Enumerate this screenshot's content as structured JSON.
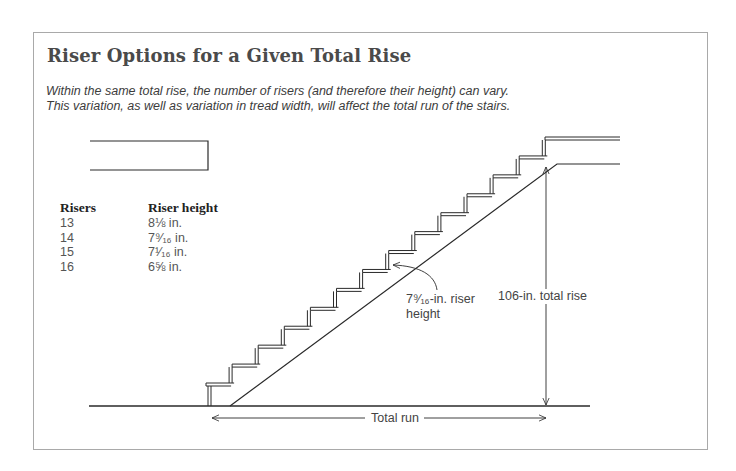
{
  "title": "Riser Options for a Given Total Rise",
  "caption": {
    "line1": "Within the same total rise, the number of risers (and therefore their height) can vary.",
    "line2": "This variation, as well as variation in tread width, will affect the total run of the stairs."
  },
  "table": {
    "headers": {
      "risers": "Risers",
      "height": "Riser height"
    },
    "rows": [
      {
        "risers": "13",
        "height": "8⅛ in."
      },
      {
        "risers": "14",
        "height": "7⁹⁄₁₆ in."
      },
      {
        "risers": "15",
        "height": "7¹⁄₁₆ in."
      },
      {
        "risers": "16",
        "height": "6⅝ in."
      }
    ]
  },
  "labels": {
    "riser_height_line1": "7⁹⁄₁₆-in. riser",
    "riser_height_line2": "height",
    "total_rise": "106-in. total rise",
    "total_run": "Total run"
  },
  "diagram": {
    "step_count": 14,
    "total_rise_in": 106,
    "riser_height_in": "7 9/16",
    "line_color": "#2a2a2a",
    "frame_color": "#a9a9a9"
  }
}
